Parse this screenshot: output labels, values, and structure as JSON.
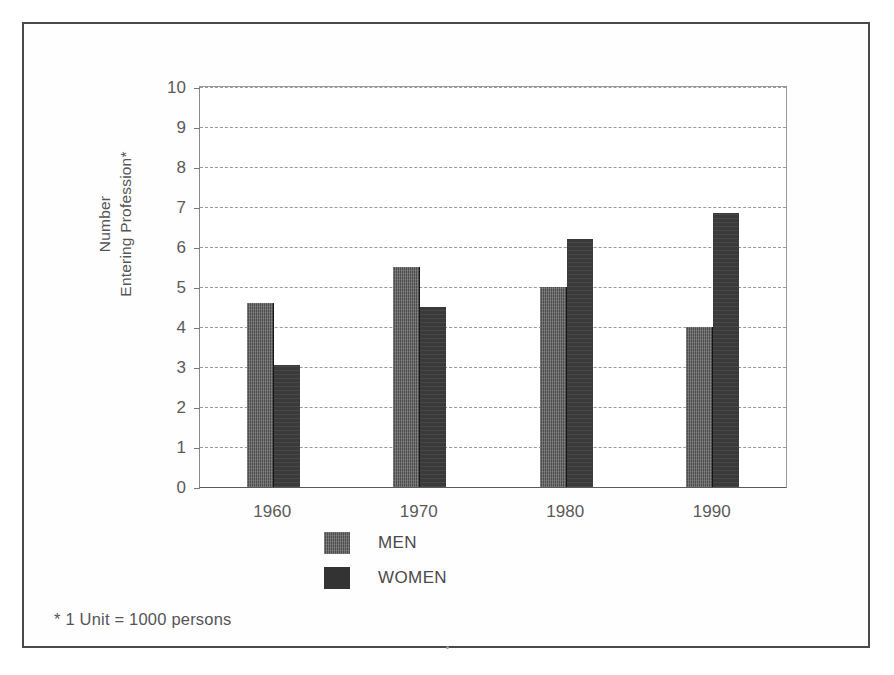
{
  "chart_data": {
    "type": "bar",
    "title": "",
    "subtitle": "",
    "xlabel": "",
    "ylabel_lines": [
      "Number",
      "Entering Profession*"
    ],
    "ylabel": "Number Entering Profession*",
    "categories": [
      "1960",
      "1970",
      "1980",
      "1990"
    ],
    "series": [
      {
        "name": "MEN",
        "values": [
          4.6,
          5.5,
          5.0,
          4.0
        ],
        "color": "#4d4d4d"
      },
      {
        "name": "WOMEN",
        "values": [
          3.05,
          4.5,
          6.2,
          6.85
        ],
        "color": "#333333"
      }
    ],
    "ylim": [
      0,
      10
    ],
    "ytick_values": [
      0,
      1,
      2,
      3,
      4,
      5,
      6,
      7,
      8,
      9,
      10
    ],
    "ytick_labels": [
      "0",
      "1",
      "2",
      "3",
      "4",
      "5",
      "6",
      "7",
      "8",
      "9",
      "10"
    ],
    "grid": true,
    "grid_style": "horizontal-dashed",
    "legend_position": "bottom-center",
    "legend_entries": [
      "MEN",
      "WOMEN"
    ],
    "annotations": [
      "* 1 Unit = 1000 persons"
    ]
  },
  "footnote": "* 1 Unit = 1000 persons",
  "legend": {
    "men_label": "MEN",
    "women_label": "WOMEN"
  }
}
